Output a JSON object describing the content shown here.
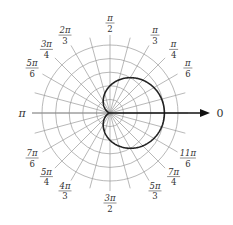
{
  "chart_data": {
    "type": "line",
    "subtype": "polar",
    "title": "",
    "equation": "r = 2 + 2cos θ",
    "curve": {
      "name": "cardioid",
      "a": 2,
      "b": 2,
      "theta_range": [
        0,
        6.283185
      ]
    },
    "r_rings": [
      1,
      2,
      3,
      4,
      5
    ],
    "r_max": 5,
    "ray_step_radians": 0.261799,
    "polar_axis_label": "0",
    "angle_labels": [
      {
        "key": "pi-over-2",
        "theta": 1.570796,
        "num": "π",
        "den": "2"
      },
      {
        "key": "pi-over-3",
        "theta": 1.047198,
        "num": "π",
        "den": "3"
      },
      {
        "key": "pi-over-4",
        "theta": 0.785398,
        "num": "π",
        "den": "4"
      },
      {
        "key": "pi-over-6",
        "theta": 0.523599,
        "num": "π",
        "den": "6"
      },
      {
        "key": "2pi-over-3",
        "theta": 2.094395,
        "num": "2π",
        "den": "3"
      },
      {
        "key": "3pi-over-4",
        "theta": 2.356194,
        "num": "3π",
        "den": "4"
      },
      {
        "key": "5pi-over-6",
        "theta": 2.617994,
        "num": "5π",
        "den": "6"
      },
      {
        "key": "pi",
        "theta": 3.141593,
        "num": "π",
        "den": ""
      },
      {
        "key": "7pi-over-6",
        "theta": 3.665191,
        "num": "7π",
        "den": "6"
      },
      {
        "key": "5pi-over-4",
        "theta": 3.926991,
        "num": "5π",
        "den": "4"
      },
      {
        "key": "4pi-over-3",
        "theta": 4.18879,
        "num": "4π",
        "den": "3"
      },
      {
        "key": "3pi-over-2",
        "theta": 4.712389,
        "num": "3π",
        "den": "2"
      },
      {
        "key": "5pi-over-3",
        "theta": 5.235988,
        "num": "5π",
        "den": "3"
      },
      {
        "key": "7pi-over-4",
        "theta": 5.497787,
        "num": "7π",
        "den": "4"
      },
      {
        "key": "11pi-over-6",
        "theta": 5.759587,
        "num": "11π",
        "den": "6"
      }
    ],
    "grid": true,
    "legend": "none"
  }
}
